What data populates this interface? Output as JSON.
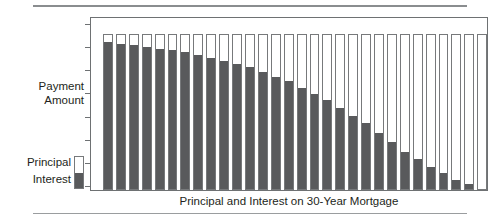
{
  "chart_data": {
    "type": "bar",
    "subtype": "stacked-bar",
    "title": "Principal and Interest on 30-Year Mortgage",
    "xlabel": "Principal and Interest on 30-Year Mortgage",
    "ylabel": "Payment Amount",
    "ylabel_lines": [
      "Payment",
      "Amount"
    ],
    "grid": false,
    "legend_position": "left-bottom",
    "y_axis_tick_labels": [],
    "y_axis_tick_count": 8,
    "x_axis_tick_labels": [],
    "ylim": [
      0,
      100
    ],
    "categories": [
      "1",
      "2",
      "3",
      "4",
      "5",
      "6",
      "7",
      "8",
      "9",
      "10",
      "11",
      "12",
      "13",
      "14",
      "15",
      "16",
      "17",
      "18",
      "19",
      "20",
      "21",
      "22",
      "23",
      "24",
      "25",
      "26",
      "27",
      "28",
      "29",
      "30"
    ],
    "series": [
      {
        "name": "Interest",
        "color": "#595a5c",
        "stack_position": "bottom",
        "values": [
          94,
          93,
          92,
          91,
          90,
          89,
          88,
          86,
          84,
          82,
          80,
          78,
          75,
          72,
          69,
          65,
          61,
          57,
          52,
          47,
          42,
          36,
          30,
          24,
          19,
          14,
          10,
          6,
          3,
          0
        ]
      },
      {
        "name": "Principal",
        "color": "#ffffff",
        "stack_position": "top",
        "values": [
          6,
          7,
          8,
          9,
          10,
          11,
          12,
          14,
          16,
          18,
          20,
          22,
          25,
          28,
          31,
          35,
          39,
          43,
          48,
          53,
          58,
          64,
          70,
          76,
          81,
          86,
          90,
          94,
          97,
          100
        ]
      }
    ],
    "total_values": [
      100,
      100,
      100,
      100,
      100,
      100,
      100,
      100,
      100,
      100,
      100,
      100,
      100,
      100,
      100,
      100,
      100,
      100,
      100,
      100,
      100,
      100,
      100,
      100,
      100,
      100,
      100,
      100,
      100,
      100
    ]
  },
  "legend": {
    "items": [
      {
        "label": "Principal",
        "color": "#ffffff"
      },
      {
        "label": "Interest",
        "color": "#595a5c"
      }
    ],
    "labels_text": "Principal\nInterest"
  },
  "colors": {
    "interest": "#595a5c",
    "principal": "#ffffff",
    "axis": "#6e7173",
    "bar_outline": "#77797b",
    "rule": "#8a8d8f",
    "text": "#231f20"
  }
}
